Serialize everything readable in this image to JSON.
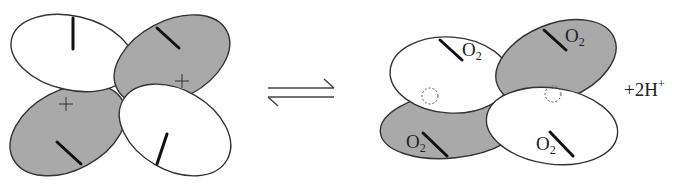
{
  "diagram": {
    "type": "orbital-equilibrium",
    "colors": {
      "shaded": "#a9a9a9",
      "unshaded": "#ffffff",
      "outline": "#333333"
    },
    "left": {
      "lobes": [
        {
          "position": "top-left",
          "shading": "white",
          "sign": ""
        },
        {
          "position": "top-right",
          "shading": "gray",
          "sign": "+"
        },
        {
          "position": "bottom-left",
          "shading": "gray",
          "sign": "+"
        },
        {
          "position": "bottom-right",
          "shading": "white",
          "sign": ""
        }
      ]
    },
    "arrow": {
      "symbol": "equilibrium"
    },
    "right": {
      "labels": {
        "o2_main": "O",
        "o2_sub": "2"
      },
      "product": "+2H",
      "product_sup": "+"
    }
  }
}
